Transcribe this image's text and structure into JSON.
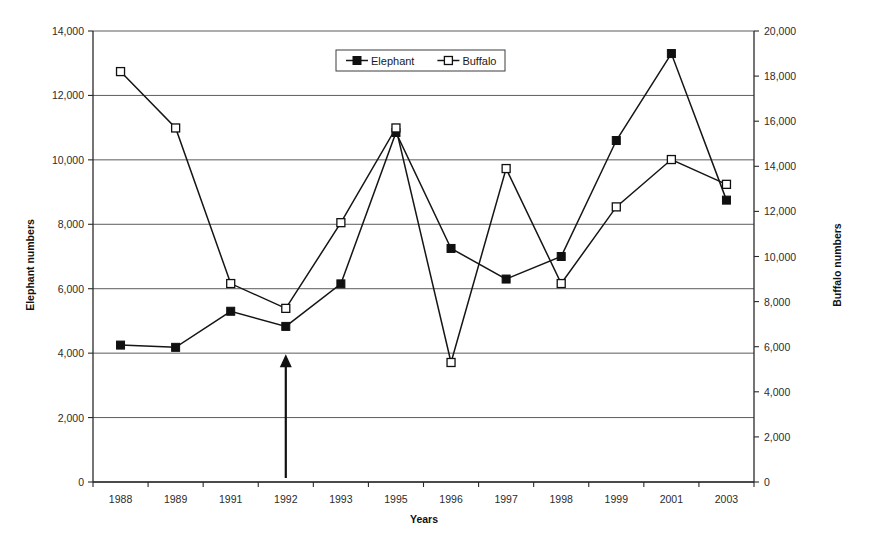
{
  "chart_data": {
    "type": "line",
    "title": "",
    "xlabel": "Years",
    "categories": [
      "1988",
      "1989",
      "1991",
      "1992",
      "1993",
      "1995",
      "1996",
      "1997",
      "1998",
      "1999",
      "2001",
      "2003"
    ],
    "grid": true,
    "legend_position": "top-center",
    "axes": {
      "left": {
        "label": "Elephant numbers",
        "min": 0,
        "max": 14000,
        "step": 2000,
        "ticks": [
          "0",
          "2,000",
          "4,000",
          "6,000",
          "8,000",
          "10,000",
          "12,000",
          "14,000"
        ]
      },
      "right": {
        "label": "Buffalo numbers",
        "min": 0,
        "max": 20000,
        "step": 2000,
        "ticks": [
          "0",
          "2,000",
          "4,000",
          "6,000",
          "8,000",
          "10,000",
          "12,000",
          "14,000",
          "16,000",
          "18,000",
          "20,000"
        ]
      }
    },
    "series": [
      {
        "name": "Elephant",
        "axis": "left",
        "marker": "filled-square",
        "values": [
          4250,
          4180,
          5300,
          4830,
          6150,
          10850,
          7250,
          6300,
          7000,
          10600,
          13300,
          8750
        ]
      },
      {
        "name": "Buffalo",
        "axis": "right",
        "marker": "open-square",
        "values": [
          18200,
          15700,
          8800,
          7700,
          11500,
          15700,
          5300,
          13900,
          8800,
          12200,
          14300,
          13200
        ]
      }
    ],
    "annotations": [
      {
        "type": "arrow-up",
        "at_category": "1992",
        "from_value": 0,
        "to_value": 3900
      }
    ]
  },
  "legend": {
    "entries": [
      {
        "label": "Elephant",
        "marker": "filled-square"
      },
      {
        "label": "Buffalo",
        "marker": "open-square"
      }
    ]
  },
  "colors": {
    "series": "#101010",
    "grid": "#4a4a4a",
    "axis": "#2a2a2a",
    "background": "#ffffff"
  }
}
